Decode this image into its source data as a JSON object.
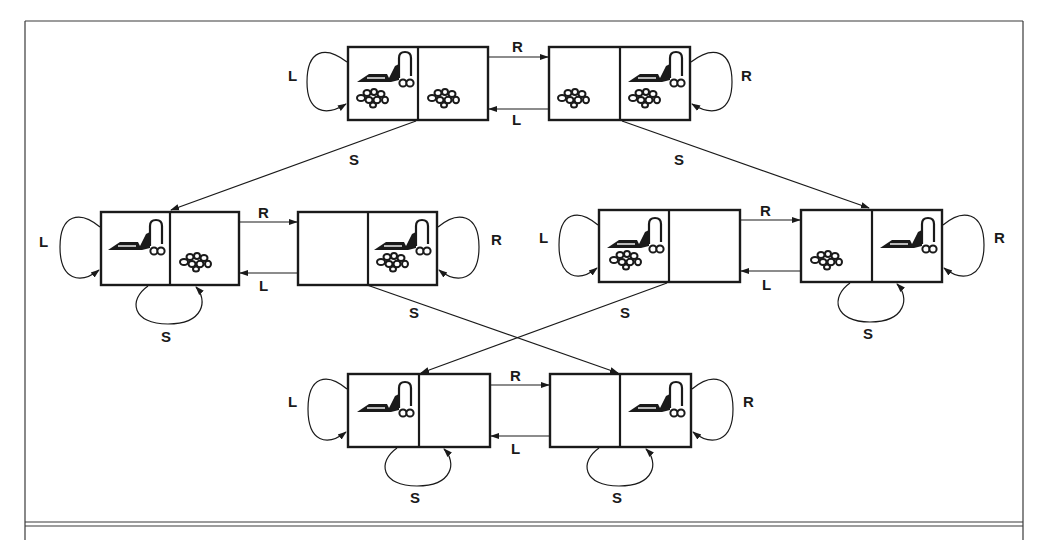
{
  "figure": {
    "actions": {
      "L": "L",
      "R": "R",
      "S": "S"
    },
    "colors": {
      "ink": "#1a1a1a",
      "frame": "#3a3a3a",
      "background": "#ffffff"
    }
  },
  "states": [
    {
      "id": 1,
      "x": 348,
      "y": 47,
      "agent": "left",
      "dirt_left": true,
      "dirt_right": true
    },
    {
      "id": 2,
      "x": 549,
      "y": 47,
      "agent": "right",
      "dirt_left": true,
      "dirt_right": true
    },
    {
      "id": 3,
      "x": 101,
      "y": 212,
      "agent": "left",
      "dirt_left": false,
      "dirt_right": true
    },
    {
      "id": 4,
      "x": 298,
      "y": 212,
      "agent": "right",
      "dirt_left": false,
      "dirt_right": true
    },
    {
      "id": 5,
      "x": 599,
      "y": 210,
      "agent": "left",
      "dirt_left": true,
      "dirt_right": false
    },
    {
      "id": 6,
      "x": 801,
      "y": 210,
      "agent": "right",
      "dirt_left": true,
      "dirt_right": false
    },
    {
      "id": 7,
      "x": 348,
      "y": 374,
      "agent": "left",
      "dirt_left": false,
      "dirt_right": false
    },
    {
      "id": 8,
      "x": 550,
      "y": 374,
      "agent": "right",
      "dirt_left": false,
      "dirt_right": false
    }
  ],
  "transitions": [
    {
      "from": 1,
      "to": 2,
      "label": "R"
    },
    {
      "from": 2,
      "to": 1,
      "label": "L"
    },
    {
      "from": 1,
      "to": 1,
      "label": "L"
    },
    {
      "from": 2,
      "to": 2,
      "label": "R"
    },
    {
      "from": 1,
      "to": 3,
      "label": "S"
    },
    {
      "from": 2,
      "to": 6,
      "label": "S"
    },
    {
      "from": 3,
      "to": 4,
      "label": "R"
    },
    {
      "from": 4,
      "to": 3,
      "label": "L"
    },
    {
      "from": 3,
      "to": 3,
      "label": "L"
    },
    {
      "from": 4,
      "to": 4,
      "label": "R"
    },
    {
      "from": 3,
      "to": 3,
      "label": "S"
    },
    {
      "from": 4,
      "to": 8,
      "label": "S"
    },
    {
      "from": 5,
      "to": 6,
      "label": "R"
    },
    {
      "from": 6,
      "to": 5,
      "label": "L"
    },
    {
      "from": 5,
      "to": 5,
      "label": "L"
    },
    {
      "from": 6,
      "to": 6,
      "label": "R"
    },
    {
      "from": 6,
      "to": 6,
      "label": "S"
    },
    {
      "from": 5,
      "to": 7,
      "label": "S"
    },
    {
      "from": 7,
      "to": 8,
      "label": "R"
    },
    {
      "from": 8,
      "to": 7,
      "label": "L"
    },
    {
      "from": 7,
      "to": 7,
      "label": "L"
    },
    {
      "from": 8,
      "to": 8,
      "label": "R"
    },
    {
      "from": 7,
      "to": 7,
      "label": "S"
    },
    {
      "from": 8,
      "to": 8,
      "label": "S"
    }
  ],
  "labels": {
    "s1_loop": "L",
    "s1_s2": "R",
    "s2_s1": "L",
    "s2_loop": "R",
    "s1_s3": "S",
    "s2_s6": "S",
    "s3_loop": "L",
    "s3_s4": "R",
    "s4_s3": "L",
    "s4_loop": "R",
    "s3_suck": "S",
    "s4_s8": "S",
    "s5_loop": "L",
    "s5_s6": "R",
    "s6_s5": "L",
    "s6_loop": "R",
    "s6_suck": "S",
    "s5_s7": "S",
    "s7_loop": "L",
    "s7_s8": "R",
    "s8_s7": "L",
    "s8_loop": "R",
    "s7_suck": "S",
    "s8_suck": "S"
  }
}
